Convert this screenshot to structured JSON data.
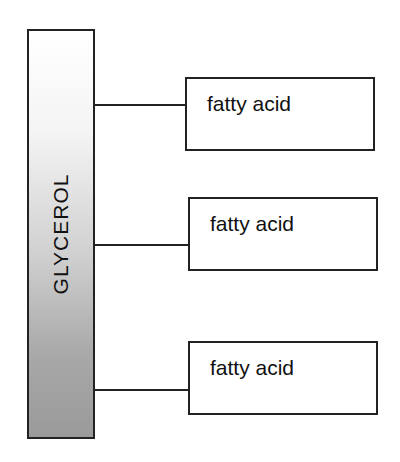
{
  "diagram": {
    "backbone": {
      "label": "GLYCEROL"
    },
    "branches": [
      {
        "label": "fatty acid"
      },
      {
        "label": "fatty acid"
      },
      {
        "label": "fatty acid"
      }
    ]
  },
  "colors": {
    "stroke": "#222222",
    "gradient_top": "#ffffff",
    "gradient_bottom": "#9a9a9a"
  }
}
